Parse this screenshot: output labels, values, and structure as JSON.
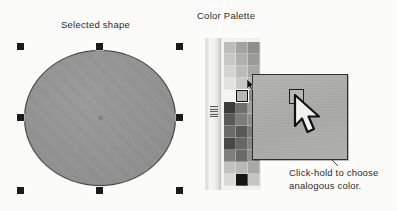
{
  "labels": {
    "selected_shape": "Selected shape",
    "color_palette": "Color Palette"
  },
  "annotation": {
    "line1": "Click-hold to choose",
    "line2": "analogous color."
  },
  "shape": {
    "type": "ellipse",
    "fill_color": "#949494",
    "stroke_color": "#3a3a3a",
    "center_marker": "×",
    "handle_color": "#1a1a1a",
    "handles": [
      {
        "name": "handle-top-left",
        "x": 17,
        "y": 43
      },
      {
        "name": "handle-top-center",
        "x": 96,
        "y": 43
      },
      {
        "name": "handle-top-right",
        "x": 176,
        "y": 43
      },
      {
        "name": "handle-middle-left",
        "x": 17,
        "y": 114
      },
      {
        "name": "handle-middle-right",
        "x": 176,
        "y": 114
      },
      {
        "name": "handle-bottom-left",
        "x": 17,
        "y": 187
      },
      {
        "name": "handle-bottom-center",
        "x": 96,
        "y": 187
      },
      {
        "name": "handle-bottom-right",
        "x": 176,
        "y": 187
      }
    ]
  },
  "palette": {
    "columns": 3,
    "selected_index": 13,
    "rail_grip": "drag-grip",
    "swatches": [
      "#bdbdbb",
      "#a3a3a1",
      "#8f8f8d",
      "#c7c7c5",
      "#b0b0ae",
      "#9a9a98",
      "#d4d4d2",
      "#bcbcba",
      "#a6a6a4",
      "#e2e2e0",
      "#c9c9c7",
      "#b2b2b0",
      "#f4f4f2",
      "#b7b7b5",
      "#8a8a88",
      "#3c3c3a",
      "#6e6e6c",
      "#9d9d9b",
      "#5a5a58",
      "#7c7c7a",
      "#8d8d8b",
      "#6b6b69",
      "#585856",
      "#7a7a78",
      "#48484a",
      "#666664",
      "#858583",
      "#7f7f7d",
      "#6a6a68",
      "#909090",
      "#c2c2c0",
      "#b9b9b7",
      "#a8a8a6",
      "#d9d9d7",
      "#151513",
      "#c5c5c3"
    ]
  },
  "zoom_popup": {
    "background_color": "#aeaeac",
    "cell_border_color": "#1c1c1c",
    "cursor": "arrow-pointer"
  }
}
